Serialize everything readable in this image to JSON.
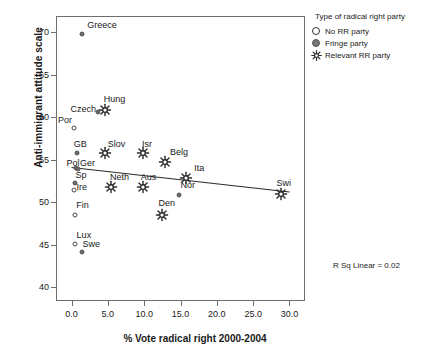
{
  "chart_data": {
    "type": "scatter",
    "title": "",
    "xlabel": "% Vote radical right 2000-2004",
    "ylabel": "Anti-immigrant attitude scale",
    "xlim": [
      -2.0,
      32.0
    ],
    "ylim": [
      38.5,
      71.8
    ],
    "xticks": [
      "0.0",
      "5.0",
      "10.0",
      "15.0",
      "20.0",
      "25.0",
      "30.0"
    ],
    "xtick_values": [
      0,
      5,
      10,
      15,
      20,
      25,
      30
    ],
    "yticks": [
      "40",
      "45",
      "50",
      "55",
      "60",
      "65",
      "70"
    ],
    "ytick_values": [
      40,
      45,
      50,
      55,
      60,
      65,
      70
    ],
    "grid": false,
    "annotation": "R Sq Linear = 0.02",
    "trendline": {
      "x0": 0.0,
      "y0": 54.1,
      "x1": 30.0,
      "y1": 51.2
    },
    "legend": {
      "position": "right-top",
      "title": "Type of radical right party",
      "entries": [
        {
          "label": "No RR party",
          "marker": "open-circle"
        },
        {
          "label": "Fringe party",
          "marker": "filled-circle"
        },
        {
          "label": "Relevant RR party",
          "marker": "star"
        }
      ]
    },
    "points": [
      {
        "label": "Greece",
        "x": 1.5,
        "y": 69.8,
        "marker": "filled-circle",
        "lx": 4.2,
        "ly": 70.9
      },
      {
        "label": "Hung",
        "x": 4.6,
        "y": 60.8,
        "marker": "star",
        "lx": 5.9,
        "ly": 62.2
      },
      {
        "label": "Czech",
        "x": 3.6,
        "y": 60.6,
        "marker": "filled-circle",
        "lx": 1.6,
        "ly": 61.0
      },
      {
        "label": "Por",
        "x": 0.3,
        "y": 58.7,
        "marker": "open-circle",
        "lx": -0.9,
        "ly": 59.7
      },
      {
        "label": "GB",
        "x": 0.8,
        "y": 55.8,
        "marker": "filled-circle",
        "lx": 1.2,
        "ly": 56.9
      },
      {
        "label": "Slov",
        "x": 4.6,
        "y": 55.8,
        "marker": "star",
        "lx": 6.2,
        "ly": 56.9
      },
      {
        "label": "Isr",
        "x": 9.8,
        "y": 55.8,
        "marker": "star",
        "lx": 10.4,
        "ly": 56.9
      },
      {
        "label": "Belg",
        "x": 12.9,
        "y": 54.7,
        "marker": "star",
        "lx": 14.8,
        "ly": 55.9
      },
      {
        "label": "Pol",
        "x": 0.6,
        "y": 54.0,
        "marker": "filled-circle",
        "lx": 0.2,
        "ly": 54.6
      },
      {
        "label": "Ger",
        "x": 0.9,
        "y": 53.9,
        "marker": "filled-circle",
        "lx": 2.2,
        "ly": 54.6
      },
      {
        "label": "Ita",
        "x": 15.8,
        "y": 52.9,
        "marker": "star",
        "lx": 17.6,
        "ly": 54.0
      },
      {
        "label": "Sp",
        "x": 0.5,
        "y": 52.3,
        "marker": "filled-circle",
        "lx": 1.3,
        "ly": 53.2
      },
      {
        "label": "Neth",
        "x": 5.4,
        "y": 51.8,
        "marker": "star",
        "lx": 6.6,
        "ly": 53.0
      },
      {
        "label": "Aus",
        "x": 9.9,
        "y": 51.8,
        "marker": "star",
        "lx": 10.6,
        "ly": 53.0
      },
      {
        "label": "Ire",
        "x": 0.4,
        "y": 51.5,
        "marker": "open-circle",
        "lx": 1.4,
        "ly": 51.8
      },
      {
        "label": "Swi",
        "x": 28.8,
        "y": 51.0,
        "marker": "star",
        "lx": 29.2,
        "ly": 52.3
      },
      {
        "label": "Nor",
        "x": 14.8,
        "y": 50.8,
        "marker": "filled-circle",
        "lx": 16.0,
        "ly": 52.0
      },
      {
        "label": "Fin",
        "x": 0.5,
        "y": 48.5,
        "marker": "open-circle",
        "lx": 1.5,
        "ly": 49.7
      },
      {
        "label": "Den",
        "x": 12.4,
        "y": 48.5,
        "marker": "star",
        "lx": 13.1,
        "ly": 49.9
      },
      {
        "label": "Lux",
        "x": 0.5,
        "y": 45.1,
        "marker": "open-circle",
        "lx": 1.7,
        "ly": 46.2
      },
      {
        "label": "Swe",
        "x": 1.5,
        "y": 44.1,
        "marker": "filled-circle",
        "lx": 2.7,
        "ly": 45.1
      }
    ]
  }
}
